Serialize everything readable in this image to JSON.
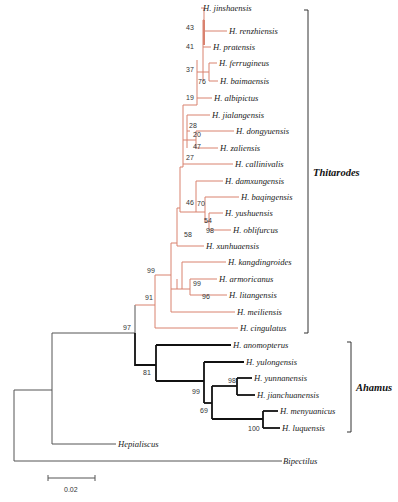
{
  "figure": {
    "type": "phylogenetic-tree",
    "scale_bar_label": "0.02",
    "colors": {
      "thitarodes_branch": "#d9826f",
      "ahamus_branch": "#111111",
      "outgroup_branch": "#555555"
    }
  },
  "clades": {
    "thitarodes": {
      "label": "Thitarodes"
    },
    "ahamus": {
      "label": "Ahamus"
    }
  },
  "taxa": [
    {
      "name": "H. jinshaensis",
      "x": 203,
      "y": 8
    },
    {
      "name": "H. renzhiensis",
      "x": 229,
      "y": 31
    },
    {
      "name": "H. pratensis",
      "x": 213,
      "y": 47
    },
    {
      "name": "H. ferrugineus",
      "x": 219,
      "y": 63
    },
    {
      "name": "H. baimaensis",
      "x": 220,
      "y": 81
    },
    {
      "name": "H. albipictus",
      "x": 214,
      "y": 98
    },
    {
      "name": "H. jialangensis",
      "x": 212,
      "y": 115
    },
    {
      "name": "H. dongyuensis",
      "x": 236,
      "y": 131
    },
    {
      "name": "H. zaliensis",
      "x": 220,
      "y": 148
    },
    {
      "name": "H. callinivalis",
      "x": 235,
      "y": 164
    },
    {
      "name": "H. damxungensis",
      "x": 225,
      "y": 181
    },
    {
      "name": "H. baqingensis",
      "x": 241,
      "y": 197
    },
    {
      "name": "H. yushuensis",
      "x": 225,
      "y": 213
    },
    {
      "name": "H. oblifurcus",
      "x": 233,
      "y": 230
    },
    {
      "name": "H. xunhuaensis",
      "x": 206,
      "y": 246
    },
    {
      "name": "H. kangdingroides",
      "x": 228,
      "y": 262
    },
    {
      "name": "H. armoricanus",
      "x": 219,
      "y": 279
    },
    {
      "name": "H. litangensis",
      "x": 229,
      "y": 295
    },
    {
      "name": "H. meiliensis",
      "x": 237,
      "y": 312
    },
    {
      "name": "H. cingulatus",
      "x": 240,
      "y": 328
    },
    {
      "name": "H. anomopterus",
      "x": 233,
      "y": 345
    },
    {
      "name": "H. yulongensis",
      "x": 246,
      "y": 362
    },
    {
      "name": "H. yunnanensis",
      "x": 254,
      "y": 378
    },
    {
      "name": "H. jianchuanensis",
      "x": 257,
      "y": 395
    },
    {
      "name": "H. menyuanicus",
      "x": 280,
      "y": 411
    },
    {
      "name": "H. luquensis",
      "x": 282,
      "y": 428
    },
    {
      "name": "Hepialiscus",
      "x": 118,
      "y": 444
    },
    {
      "name": "Bipectilus",
      "x": 283,
      "y": 461
    }
  ],
  "support_values": [
    {
      "value": "43",
      "x": 186,
      "y": 28
    },
    {
      "value": "41",
      "x": 186,
      "y": 47
    },
    {
      "value": "37",
      "x": 186,
      "y": 73
    },
    {
      "value": "76",
      "x": 200,
      "y": 82
    },
    {
      "value": "19",
      "x": 186,
      "y": 98
    },
    {
      "value": "28",
      "x": 189,
      "y": 127
    },
    {
      "value": "20",
      "x": 194,
      "y": 135
    },
    {
      "value": "47",
      "x": 194,
      "y": 148
    },
    {
      "value": "27",
      "x": 186,
      "y": 161
    },
    {
      "value": "46",
      "x": 186,
      "y": 204
    },
    {
      "value": "70",
      "x": 197,
      "y": 204
    },
    {
      "value": "54",
      "x": 204,
      "y": 222
    },
    {
      "value": "98",
      "x": 206,
      "y": 232
    },
    {
      "value": "58",
      "x": 185,
      "y": 237
    },
    {
      "value": "99",
      "x": 148,
      "y": 272
    },
    {
      "value": "99",
      "x": 193,
      "y": 284
    },
    {
      "value": "96",
      "x": 202,
      "y": 298
    },
    {
      "value": "91",
      "x": 146,
      "y": 299
    },
    {
      "value": "97",
      "x": 124,
      "y": 329
    },
    {
      "value": "81",
      "x": 144,
      "y": 374
    },
    {
      "value": "99",
      "x": 192,
      "y": 392
    },
    {
      "value": "98",
      "x": 228,
      "y": 382
    },
    {
      "value": "69",
      "x": 200,
      "y": 412
    },
    {
      "value": "100",
      "x": 250,
      "y": 430
    }
  ]
}
